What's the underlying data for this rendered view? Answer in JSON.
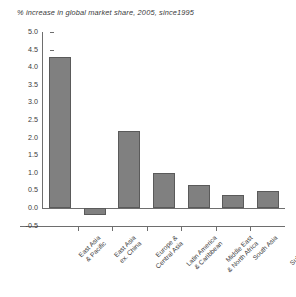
{
  "chart_data": {
    "type": "bar",
    "title": "% increase in global market share, 2005, since1995",
    "xlabel": "",
    "ylabel": "",
    "ylim": [
      -0.5,
      5.0
    ],
    "ytick_step": 0.5,
    "grid": false,
    "legend": "none",
    "categories": [
      "East Asia & Pacific",
      "East Asia ex. China",
      "Europe & Central Asia",
      "Latin America & Caribbean",
      "Middle East & North Africa",
      "South Asia",
      "Sub-Saharan Africa"
    ],
    "category_lines": [
      [
        "East Asia",
        "& Pacific"
      ],
      [
        "East Asia",
        "ex. China"
      ],
      [
        "Europe &",
        "Central Asia"
      ],
      [
        "Latin America",
        "& Caribbean"
      ],
      [
        "Middle East",
        "& North Africa"
      ],
      [
        "South Asia",
        ""
      ],
      [
        "Sub-Saharan",
        "Africa"
      ]
    ],
    "values": [
      4.3,
      -0.2,
      2.2,
      1.0,
      0.65,
      0.38,
      0.48
    ],
    "yticks": [
      "5.0",
      "4.5",
      "4.0",
      "3.5",
      "3.0",
      "2.5",
      "2.0",
      "1.5",
      "1.0",
      "0.5",
      "0.0",
      "-0.5"
    ],
    "ytick_values": [
      5.0,
      4.5,
      4.0,
      3.5,
      3.0,
      2.5,
      2.0,
      1.5,
      1.0,
      0.5,
      0.0,
      -0.5
    ],
    "bar_color": "#808080",
    "bar_edge_color": "#5a5a5a",
    "axis_color": "#6e6e6e",
    "text_color": "#3a3a3a",
    "background": "#ffffff"
  }
}
